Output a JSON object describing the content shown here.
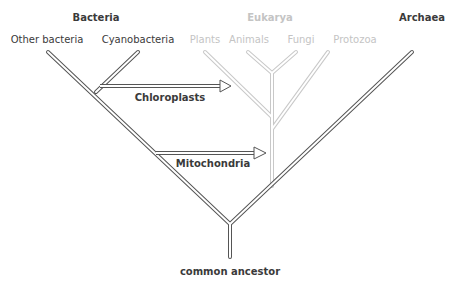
{
  "colors": {
    "dark_branch": "#555555",
    "faint_branch": "#c8c8c8",
    "dark_text": "#3a3a3a",
    "faint_text": "#c4c4c4"
  },
  "domains": {
    "bacteria": "Bacteria",
    "eukarya": "Eukarya",
    "archaea": "Archaea"
  },
  "leaves": {
    "other_bacteria": "Other bacteria",
    "cyanobacteria": "Cyanobacteria",
    "plants": "Plants",
    "animals": "Animals",
    "fungi": "Fungi",
    "protozoa": "Protozoa"
  },
  "transfers": {
    "chloroplasts": "Chloroplasts",
    "mitochondria": "Mitochondria"
  },
  "root": {
    "label": "common ancestor"
  }
}
